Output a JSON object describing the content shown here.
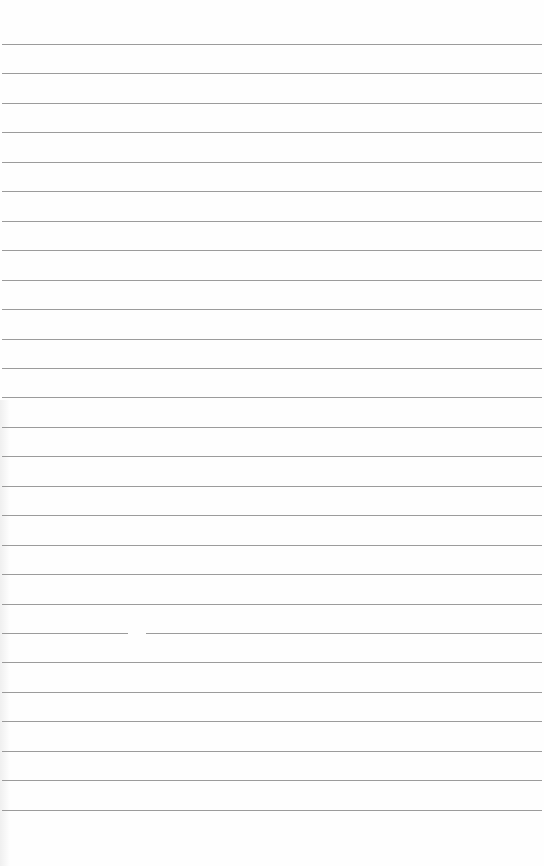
{
  "page": {
    "type": "lined-paper",
    "background_color": "#ffffff",
    "rule_color": "#8a8a8a",
    "rule_count": 27,
    "first_rule_y": 44,
    "rule_spacing": 29.45,
    "rule_gap": {
      "rule_index": 20,
      "x_start": 128,
      "x_end": 146
    }
  }
}
